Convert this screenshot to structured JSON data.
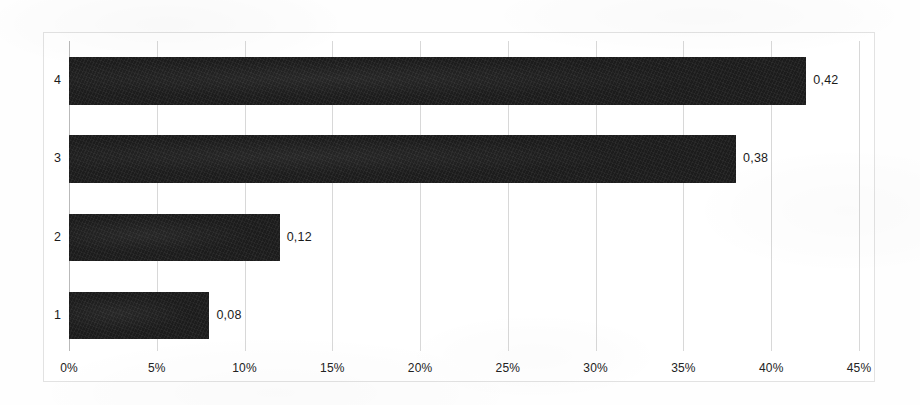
{
  "chart_data": {
    "type": "bar",
    "orientation": "horizontal",
    "title": "",
    "subtitle": "",
    "xlabel": "",
    "ylabel": "",
    "categories": [
      "1",
      "2",
      "3",
      "4"
    ],
    "values": [
      0.08,
      0.12,
      0.38,
      0.42
    ],
    "data_labels": [
      "0,08",
      "0,12",
      "0,38",
      "0,42"
    ],
    "xlim": [
      0,
      0.45
    ],
    "x_tick_values": [
      0,
      0.05,
      0.1,
      0.15,
      0.2,
      0.25,
      0.3,
      0.35,
      0.4,
      0.45
    ],
    "x_tick_labels": [
      "0%",
      "5%",
      "10%",
      "15%",
      "20%",
      "25%",
      "30%",
      "35%",
      "40%",
      "45%"
    ],
    "y_tick_labels": [
      "1",
      "2",
      "3",
      "4"
    ],
    "grid": {
      "vertical": true,
      "horizontal": false
    },
    "legend": {
      "visible": false,
      "position": "none",
      "entries": []
    },
    "bar_color": "#1c1c1c",
    "gridline_color": "#d8d8d8",
    "frame_color": "#e2e2e2",
    "plot_background": "#ffffff",
    "annotations": []
  },
  "bars": [
    {
      "category": "4",
      "label": "0,42",
      "value": 0.42,
      "top": 56,
      "height": 48
    },
    {
      "category": "3",
      "label": "0,38",
      "value": 0.38,
      "top": 134,
      "height": 48
    },
    {
      "category": "2",
      "label": "0,12",
      "value": 0.12,
      "top": 213,
      "height": 47
    },
    {
      "category": "1",
      "label": "0,08",
      "value": 0.08,
      "top": 291,
      "height": 47
    }
  ],
  "ticks": [
    {
      "label": "0%",
      "value": 0.0
    },
    {
      "label": "5%",
      "value": 0.05
    },
    {
      "label": "10%",
      "value": 0.1
    },
    {
      "label": "15%",
      "value": 0.15
    },
    {
      "label": "20%",
      "value": 0.2
    },
    {
      "label": "25%",
      "value": 0.25
    },
    {
      "label": "30%",
      "value": 0.3
    },
    {
      "label": "35%",
      "value": 0.35
    },
    {
      "label": "40%",
      "value": 0.4
    },
    {
      "label": "45%",
      "value": 0.45
    }
  ]
}
